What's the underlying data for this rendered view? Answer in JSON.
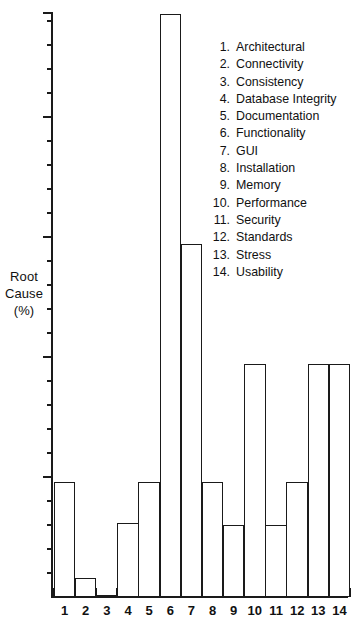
{
  "chart_data": {
    "type": "bar",
    "title": "",
    "xlabel": "",
    "ylabel": "Root Cause (%)",
    "ylabel_lines": [
      "Root",
      "Cause",
      "(%)"
    ],
    "categories": [
      "1",
      "2",
      "3",
      "4",
      "5",
      "6",
      "7",
      "8",
      "9",
      "10",
      "11",
      "12",
      "13",
      "14"
    ],
    "category_names": [
      "Architectural",
      "Connectivity",
      "Consistency",
      "Database Integrity",
      "Documentation",
      "Functionality",
      "GUI",
      "Installation",
      "Memory",
      "Performance",
      "Security",
      "Standards",
      "Stress",
      "Usability"
    ],
    "values": [
      4.8,
      0.8,
      0.1,
      3.1,
      4.8,
      24.3,
      14.7,
      4.8,
      3.0,
      9.7,
      3.0,
      4.8,
      9.7,
      9.7
    ],
    "ylim": [
      0,
      24.4
    ],
    "y_major_ticks": [
      0,
      5,
      10,
      15,
      20,
      24.4
    ],
    "y_tick_labels_shown": false,
    "grid": false,
    "legend_position": "inside-upper-right",
    "bar_fill": "#ffffff",
    "bar_edge": "#1a1a1a"
  },
  "legend": {
    "items": [
      {
        "index": "1.",
        "label": "Architectural"
      },
      {
        "index": "2.",
        "label": "Connectivity"
      },
      {
        "index": "3.",
        "label": "Consistency"
      },
      {
        "index": "4.",
        "label": "Database Integrity"
      },
      {
        "index": "5.",
        "label": "Documentation"
      },
      {
        "index": "6.",
        "label": "Functionality"
      },
      {
        "index": "7.",
        "label": "GUI"
      },
      {
        "index": "8.",
        "label": "Installation"
      },
      {
        "index": "9.",
        "label": "Memory"
      },
      {
        "index": "10.",
        "label": "Performance"
      },
      {
        "index": "11.",
        "label": "Security"
      },
      {
        "index": "12.",
        "label": "Standards"
      },
      {
        "index": "13.",
        "label": "Stress"
      },
      {
        "index": "14.",
        "label": "Usability"
      }
    ]
  },
  "axis": {
    "y_label_lines": [
      "Root",
      "Cause",
      "(%)"
    ],
    "x_tick_labels": [
      "1",
      "2",
      "3",
      "4",
      "5",
      "6",
      "7",
      "8",
      "9",
      "10",
      "11",
      "12",
      "13",
      "14"
    ]
  }
}
